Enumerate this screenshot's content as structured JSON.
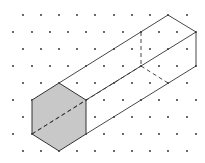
{
  "figure": {
    "colors": {
      "background": "#ffffff",
      "dot": "#222222",
      "edge": "#333333",
      "face_fill": "#c8c8c8"
    },
    "grid": {
      "rows_y": [
        15,
        32,
        49,
        66,
        83,
        100,
        117,
        134,
        151
      ],
      "odd_row_x": [
        23,
        41,
        59,
        77,
        95,
        114,
        132,
        150,
        168,
        187
      ],
      "even_row_x": [
        13,
        32,
        50,
        68,
        86,
        104,
        123,
        141,
        159,
        177,
        196
      ]
    },
    "front_face": [
      [
        59,
        83
      ],
      [
        86,
        100
      ],
      [
        86,
        134
      ],
      [
        59,
        151
      ],
      [
        32,
        134
      ],
      [
        32,
        100
      ]
    ],
    "solid_edges": [
      [
        [
          59,
          83
        ],
        [
          168,
          15
        ]
      ],
      [
        [
          168,
          15
        ],
        [
          196,
          32
        ]
      ],
      [
        [
          86,
          100
        ],
        [
          196,
          32
        ]
      ],
      [
        [
          196,
          32
        ],
        [
          196,
          66
        ]
      ],
      [
        [
          86,
          134
        ],
        [
          196,
          66
        ]
      ]
    ],
    "dashed_edges": [
      [
        [
          32,
          134
        ],
        [
          141,
          66
        ]
      ],
      [
        [
          141,
          32
        ],
        [
          141,
          66
        ]
      ],
      [
        [
          141,
          66
        ],
        [
          168,
          83
        ]
      ],
      [
        [
          32,
          134
        ],
        [
          86,
          100
        ]
      ]
    ],
    "hidden_vertex_top": [
      141,
      32
    ],
    "back_bottom_vertex": [
      168,
      83
    ]
  }
}
